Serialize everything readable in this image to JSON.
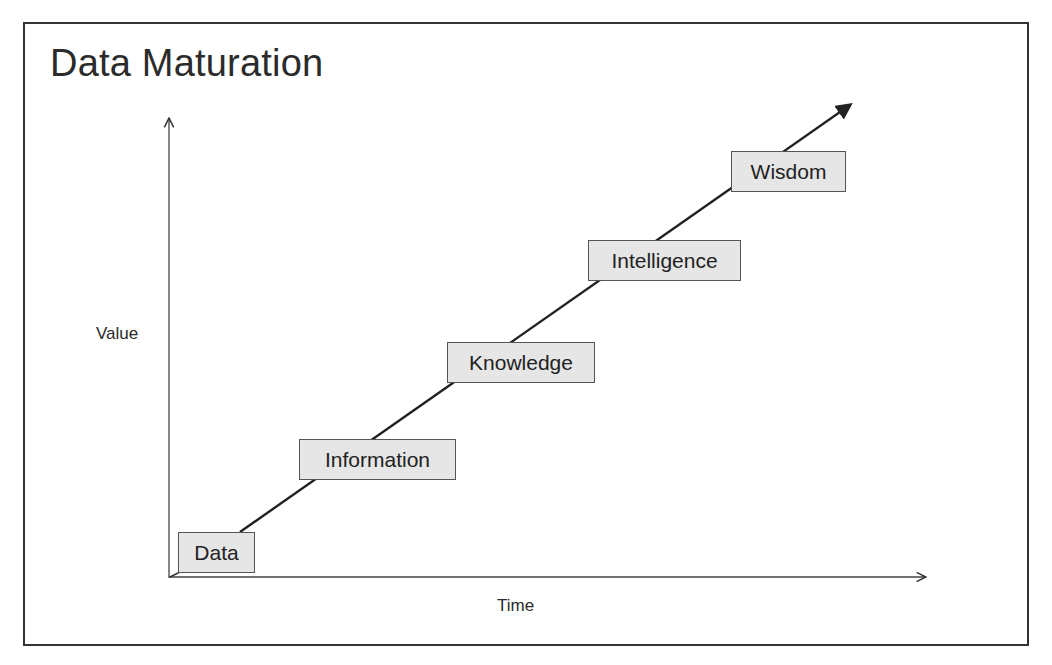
{
  "title": "Data Maturation",
  "axes": {
    "y_label": "Value",
    "x_label": "Time"
  },
  "stages": [
    {
      "label": "Data"
    },
    {
      "label": "Information"
    },
    {
      "label": "Knowledge"
    },
    {
      "label": "Intelligence"
    },
    {
      "label": "Wisdom"
    }
  ],
  "colors": {
    "frame": "#333333",
    "box_fill": "#e6e6e6",
    "box_border": "#555555",
    "line": "#222222"
  }
}
